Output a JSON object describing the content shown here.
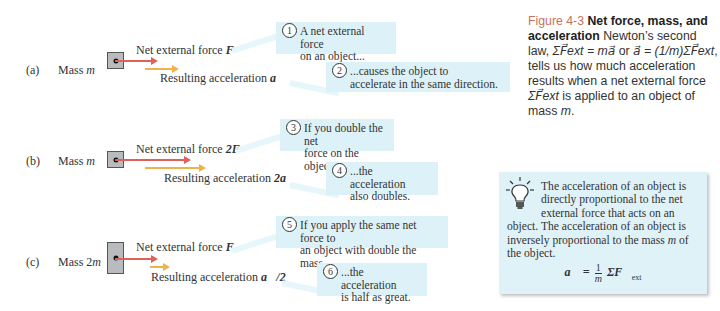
{
  "rows": [
    {
      "label": "(a)",
      "mass_label": "Mass m",
      "mass_text": "Mass ",
      "mass_var": "m",
      "force_label": "Net external force",
      "force_vec": "F⃗",
      "accel_label": "Resulting acceleration",
      "accel_vec": "a⃗",
      "callouts": [
        {
          "num": "1",
          "text": "A net external force\non an object..."
        },
        {
          "num": "2",
          "text": "...causes the object to\naccelerate in the same direction."
        }
      ]
    },
    {
      "label": "(b)",
      "mass_label": "Mass m",
      "mass_text": "Mass ",
      "mass_var": "m",
      "force_label": "Net external force",
      "force_vec": "2F⃗",
      "accel_label": "Resulting acceleration",
      "accel_vec": "2a⃗",
      "callouts": [
        {
          "num": "3",
          "text": "If you double the net\nforce on the object..."
        },
        {
          "num": "4",
          "text": "...the acceleration\nalso doubles."
        }
      ]
    },
    {
      "label": "(c)",
      "mass_label": "Mass 2m",
      "mass_text": "Mass 2",
      "mass_var": "m",
      "force_label": "Net external force",
      "force_vec": "F⃗",
      "accel_label": "Resulting acceleration",
      "accel_vec": "a⃗/2",
      "callouts": [
        {
          "num": "5",
          "text": "If you apply the same net force to\nan object with double the mass..."
        },
        {
          "num": "6",
          "text": "...the acceleration\nis half as great."
        }
      ]
    }
  ],
  "caption": {
    "figure_number": "Figure 4-3",
    "title": "Net force, mass, and acceleration",
    "body_1": "Newton’s second law, ",
    "eq_1": "ΣF⃗ext = ma⃗",
    "body_2": " or ",
    "eq_2": "a⃗ = (1/m)ΣF⃗ext",
    "body_3": ", tells us how much acceleration results when a net external force ",
    "eq_3": "ΣF⃗ext",
    "body_4": " is applied to an object of mass ",
    "mass_var": "m",
    "body_5": "."
  },
  "concept_box": {
    "icon": "lightbulb-icon",
    "text_1": "The acceleration of an object is directly proportional to the net external force that acts on an object. The acceleration of an object is inversely proportional to the mass ",
    "mass_var": "m",
    "text_2": " of the object.",
    "formula_lhs": "a⃗ =",
    "formula_num": "1",
    "formula_den": "m",
    "formula_rhs": "ΣF⃗",
    "formula_sub": "ext"
  },
  "colors": {
    "force_arrow": "#e0605a",
    "accel_arrow": "#f0b24a",
    "callout_bg": "#dcf2f8",
    "figure_number": "#c6725b",
    "block_fill": "#b9bcbe"
  }
}
